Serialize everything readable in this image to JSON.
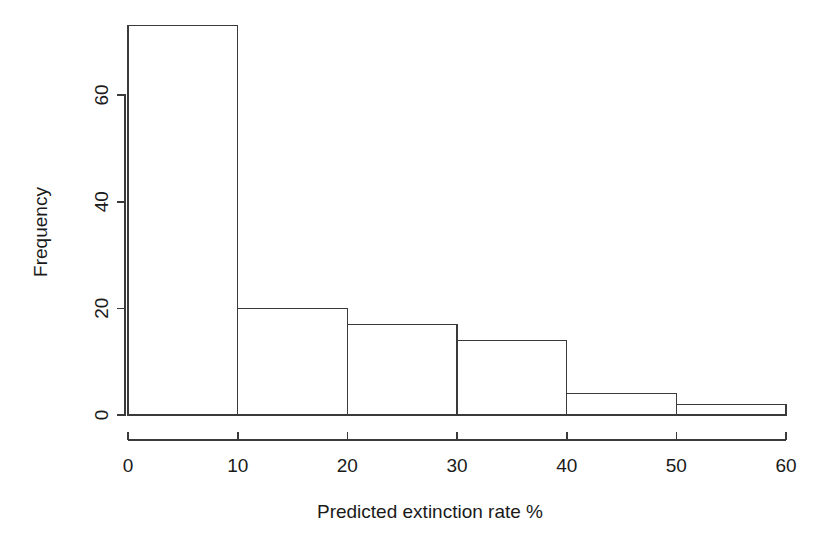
{
  "figure": {
    "background_color": "#ffffff",
    "foreground_color": "#1a1a1a",
    "axis_color": "#3a3a3a"
  },
  "chart_data": {
    "type": "bar",
    "title": "",
    "subtitle": "",
    "xlabel": "Predicted extinction rate %",
    "ylabel": "Frequency",
    "categories": [
      "0-10",
      "10-20",
      "20-30",
      "30-40",
      "40-50",
      "50-60"
    ],
    "bin_edges": [
      0,
      10,
      20,
      30,
      40,
      50,
      60
    ],
    "values": [
      73,
      20,
      17,
      14,
      4,
      2
    ],
    "xlim": [
      0,
      60
    ],
    "ylim": [
      0,
      73
    ],
    "x_ticks": [
      "0",
      "10",
      "20",
      "30",
      "40",
      "50",
      "60"
    ],
    "x_tick_values": [
      0,
      10,
      20,
      30,
      40,
      50,
      60
    ],
    "y_ticks": [
      "0",
      "20",
      "40",
      "60"
    ],
    "y_tick_values": [
      0,
      20,
      40,
      60
    ],
    "grid": false,
    "legend": null,
    "legend_position": "none",
    "annotations": [],
    "bar_fill": "#ffffff",
    "bar_stroke": "#3a3a3a"
  }
}
